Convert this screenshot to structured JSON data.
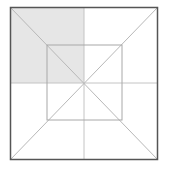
{
  "diagram": {
    "type": "nested-squares-with-diagonals",
    "colors": {
      "background": "#ffffff",
      "outer_border": "#555555",
      "inner_lines": "#bbbbbb",
      "shade": "#e6e6e6"
    },
    "outer_square": {
      "x": 10,
      "y": 7,
      "size": 148
    },
    "inner_square": {
      "x": 47,
      "y": 45,
      "size": 75
    },
    "center": {
      "x": 84,
      "y": 83
    },
    "shaded_region": "top-left-quadrant"
  }
}
